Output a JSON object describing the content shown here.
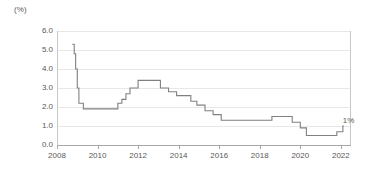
{
  "chart_data": {
    "type": "line",
    "title": "",
    "subtitle": "",
    "xlabel": "",
    "ylabel": "",
    "unit_label": "(%)",
    "grid": true,
    "legend": null,
    "legend_position": "none",
    "line_color": "#808080",
    "step_style": "post",
    "xlim": [
      2008.0,
      2022.5
    ],
    "ylim": [
      0.0,
      6.0
    ],
    "xticks": [
      2008,
      2010,
      2012,
      2014,
      2016,
      2018,
      2020,
      2022
    ],
    "xtick_labels": [
      "2008",
      "2010",
      "2012",
      "2014",
      "2016",
      "2018",
      "2020",
      "2022"
    ],
    "yticks": [
      0.0,
      1.0,
      2.0,
      3.0,
      4.0,
      5.0,
      6.0
    ],
    "ytick_labels": [
      "0.0",
      "1.0",
      "2.0",
      "3.0",
      "4.0",
      "5.0",
      "6.0"
    ],
    "annotations": [
      {
        "text": "1%",
        "x": 2021.9,
        "y": 1.0,
        "dx": 4,
        "dy": -9
      }
    ],
    "series": [
      {
        "name": "policy rate",
        "color": "#808080",
        "x": [
          2008.75,
          2008.85,
          2008.92,
          2009.0,
          2009.08,
          2009.3,
          2010.8,
          2011.0,
          2011.2,
          2011.4,
          2011.6,
          2012.0,
          2012.9,
          2013.1,
          2013.5,
          2013.9,
          2014.2,
          2014.6,
          2014.9,
          2015.3,
          2015.7,
          2016.1,
          2018.0,
          2018.6,
          2019.1,
          2019.6,
          2020.0,
          2020.3,
          2021.5,
          2021.8,
          2022.1
        ],
        "y": [
          5.3,
          4.8,
          4.0,
          3.0,
          2.2,
          1.9,
          1.9,
          2.2,
          2.4,
          2.7,
          3.0,
          3.4,
          3.4,
          3.0,
          2.8,
          2.6,
          2.6,
          2.3,
          2.1,
          1.8,
          1.6,
          1.3,
          1.3,
          1.5,
          1.5,
          1.2,
          0.9,
          0.5,
          0.5,
          0.7,
          1.0
        ]
      }
    ]
  },
  "axis": {
    "unit": "(%)"
  }
}
